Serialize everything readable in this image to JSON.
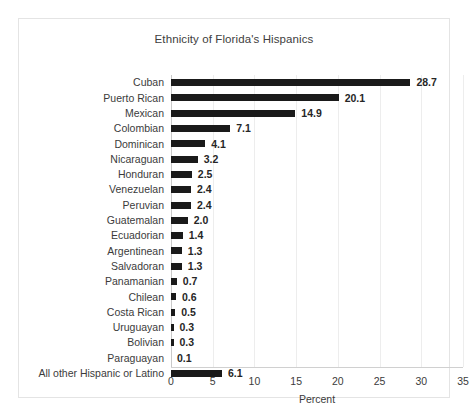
{
  "chart_data": {
    "type": "bar",
    "orientation": "horizontal",
    "title": "Ethnicity of Florida's Hispanics",
    "xlabel": "Percent",
    "ylabel": "",
    "xlim": [
      0,
      35
    ],
    "xticks": [
      0,
      5,
      10,
      15,
      20,
      25,
      30,
      35
    ],
    "xtick_labels": [
      "0",
      "5",
      "10",
      "15",
      "20",
      "25",
      "30",
      "35"
    ],
    "grid": "vertical",
    "legend": "none",
    "bar_color": "#1a1a1a",
    "categories": [
      "Cuban",
      "Puerto Rican",
      "Mexican",
      "Colombian",
      "Dominican",
      "Nicaraguan",
      "Honduran",
      "Venezuelan",
      "Peruvian",
      "Guatemalan",
      "Ecuadorian",
      "Argentinean",
      "Salvadoran",
      "Panamanian",
      "Chilean",
      "Costa Rican",
      "Uruguayan",
      "Bolivian",
      "Paraguayan",
      "All other Hispanic or Latino"
    ],
    "values": [
      28.7,
      20.1,
      14.9,
      7.1,
      4.1,
      3.2,
      2.5,
      2.4,
      2.4,
      2.0,
      1.4,
      1.3,
      1.3,
      0.7,
      0.6,
      0.5,
      0.3,
      0.3,
      0.1,
      6.1
    ],
    "value_labels": [
      "28.7",
      "20.1",
      "14.9",
      "7.1",
      "4.1",
      "3.2",
      "2.5",
      "2.4",
      "2.4",
      "2.0",
      "1.4",
      "1.3",
      "1.3",
      "0.7",
      "0.6",
      "0.5",
      "0.3",
      "0.3",
      "0.1",
      "6.1"
    ]
  },
  "colors": {
    "bar": "#1a1a1a",
    "frame": "#e4e4e4",
    "gridline": "#ededed",
    "text": "#3b3b3b",
    "background": "#ffffff"
  }
}
